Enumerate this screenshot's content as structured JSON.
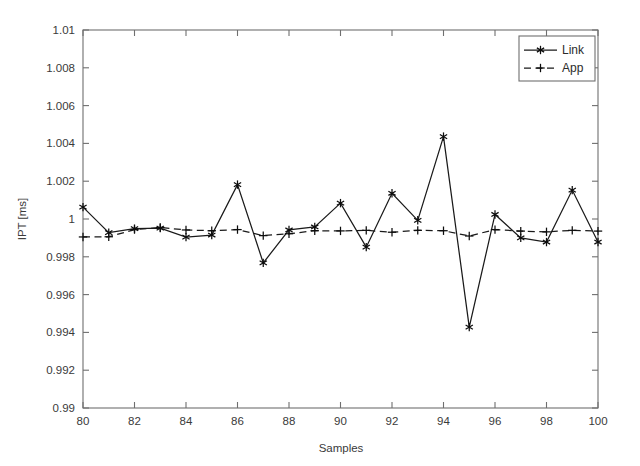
{
  "chart_data": {
    "type": "line",
    "title": "",
    "xlabel": "Samples",
    "ylabel": "IPT [ms]",
    "xlim": [
      80,
      100
    ],
    "ylim": [
      0.99,
      1.01
    ],
    "xticks": [
      80,
      82,
      84,
      86,
      88,
      90,
      92,
      94,
      96,
      98,
      100
    ],
    "xticklabels": [
      "80",
      "82",
      "84",
      "86",
      "88",
      "90",
      "92",
      "94",
      "96",
      "98",
      "100"
    ],
    "yticks": [
      0.99,
      0.992,
      0.994,
      0.996,
      0.998,
      1,
      1.002,
      1.004,
      1.006,
      1.008,
      1.01
    ],
    "yticklabels": [
      "0.99",
      "0.992",
      "0.994",
      "0.996",
      "0.998",
      "1",
      "1.002",
      "1.004",
      "1.006",
      "1.008",
      "1.01"
    ],
    "grid": false,
    "legend_position": "upper right",
    "x": [
      80,
      81,
      82,
      83,
      84,
      85,
      86,
      87,
      88,
      89,
      90,
      91,
      92,
      93,
      94,
      95,
      96,
      97,
      98,
      99,
      100
    ],
    "series": [
      {
        "name": "Link",
        "marker": "asterisk",
        "linestyle": "solid",
        "color": "#1a1a1a",
        "values": [
          1.00063,
          0.99928,
          0.99949,
          0.99952,
          0.99904,
          0.99915,
          1.00182,
          0.99768,
          0.99942,
          0.99958,
          1.00084,
          0.99851,
          1.00136,
          0.99993,
          1.00436,
          0.99428,
          1.00024,
          0.999,
          0.99878,
          1.00153,
          0.99878
        ]
      },
      {
        "name": "App",
        "marker": "plus",
        "linestyle": "dashed",
        "color": "#1a1a1a",
        "values": [
          0.99905,
          0.99906,
          0.99944,
          0.99955,
          0.99942,
          0.99938,
          0.99944,
          0.99912,
          0.99922,
          0.99938,
          0.99937,
          0.9994,
          0.9993,
          0.9994,
          0.99938,
          0.9991,
          0.99944,
          0.99936,
          0.99932,
          0.9994,
          0.99936
        ]
      }
    ]
  },
  "legend": {
    "entries": [
      {
        "label": "Link"
      },
      {
        "label": "App"
      }
    ]
  }
}
